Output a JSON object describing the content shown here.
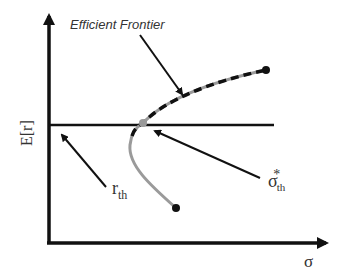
{
  "diagram": {
    "labels": {
      "frontier": "Efficient Frontier",
      "y_axis": "E[r]",
      "x_axis": "σ",
      "r_th_main": "r",
      "r_th_sub": "th",
      "sigma_main": "σ",
      "sigma_sub": "th",
      "sigma_sup": "*"
    },
    "colors": {
      "axis": "#111111",
      "curve": "#9a9a9a",
      "frontier_dash": "#111111",
      "tangent_point": "#9a9a9a",
      "endpoint": "#111111"
    }
  }
}
